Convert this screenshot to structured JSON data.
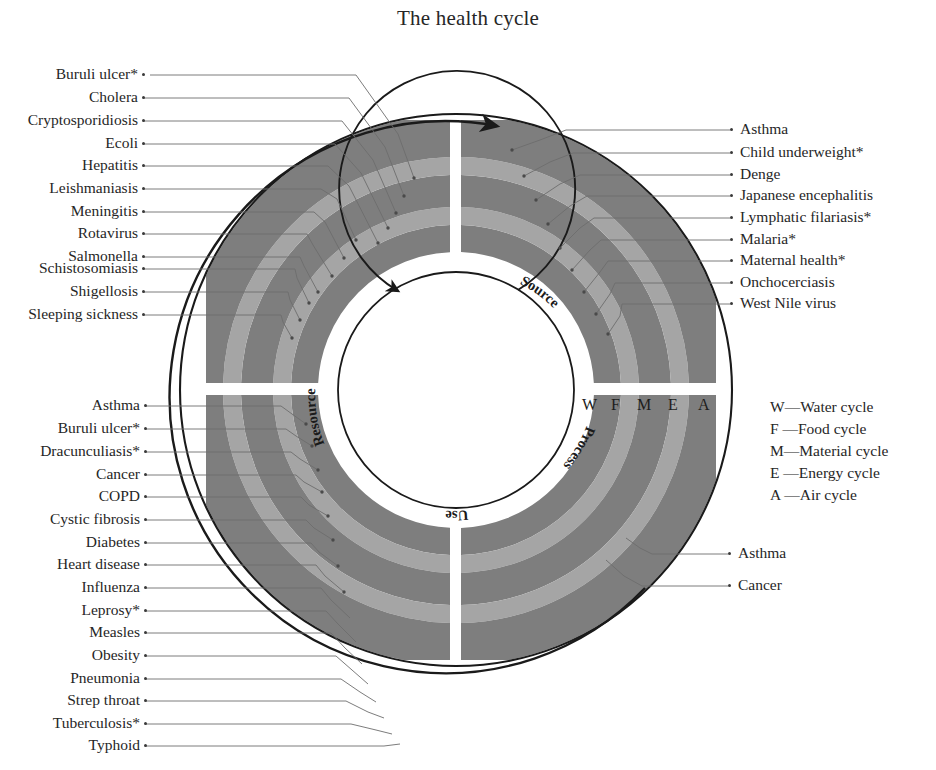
{
  "title": "The health cycle",
  "colors": {
    "band_dark": "#7e7e7e",
    "band_light": "#a5a5a5",
    "outline": "#1a1a1a",
    "leader": "#6d6d6d",
    "text": "#262626",
    "background": "#ffffff"
  },
  "chart_data": {
    "type": "diagram",
    "title": "The health cycle",
    "shape": "concentric-ring donut split into four quadrants",
    "rings": [
      {
        "code": "W",
        "name": "Water cycle",
        "order": 1,
        "tone": "dark"
      },
      {
        "code": "F",
        "name": "Food cycle",
        "order": 2,
        "tone": "light"
      },
      {
        "code": "M",
        "name": "Material cycle",
        "order": 3,
        "tone": "dark"
      },
      {
        "code": "E",
        "name": "Energy cycle",
        "order": 4,
        "tone": "light"
      },
      {
        "code": "A",
        "name": "Air cycle",
        "order": 5,
        "tone": "dark"
      }
    ],
    "quadrants": [
      "Source",
      "Process",
      "Use",
      "Resource"
    ],
    "ring_axis_labels": [
      "W",
      "F",
      "M",
      "E",
      "A"
    ],
    "direction": "clockwise",
    "groups": [
      {
        "quadrant": "Resource",
        "position": "top-left",
        "count": 12
      },
      {
        "quadrant": "Source",
        "position": "top-right",
        "count": 9
      },
      {
        "quadrant": "Use",
        "position": "bottom-left",
        "count": 15
      },
      {
        "quadrant": "Process",
        "position": "bottom-right",
        "count": 2
      }
    ]
  },
  "inner_labels": {
    "source": "Source",
    "process": "Process",
    "use": "Use",
    "resource": "Resource"
  },
  "ring_axis": {
    "w": "W",
    "f": "F",
    "m": "M",
    "e": "E",
    "a": "A"
  },
  "legend": {
    "items": [
      {
        "code": "W",
        "dash": "—",
        "label": "Water cycle",
        "text": "W—Water cycle"
      },
      {
        "code": "F",
        "dash": "—",
        "label": "Food cycle",
        "text": "F —Food cycle"
      },
      {
        "code": "M",
        "dash": "—",
        "label": "Material cycle",
        "text": "M—Material cycle"
      },
      {
        "code": "E",
        "dash": "—",
        "label": "Energy cycle",
        "text": "E —Energy cycle"
      },
      {
        "code": "A",
        "dash": "—",
        "label": "Air cycle",
        "text": "A —Air cycle"
      }
    ]
  },
  "labels_top_left": [
    {
      "text": "Buruli ulcer*",
      "y": 75
    },
    {
      "text": "Cholera",
      "y": 98
    },
    {
      "text": "Cryptosporidiosis",
      "y": 121
    },
    {
      "text": "Ecoli",
      "y": 144
    },
    {
      "text": "Hepatitis",
      "y": 166
    },
    {
      "text": "Leishmaniasis",
      "y": 189
    },
    {
      "text": "Meningitis",
      "y": 212
    },
    {
      "text": "Rotavirus",
      "y": 234
    },
    {
      "text": "Salmonella",
      "y": 257
    },
    {
      "text": "Schistosomiasis",
      "y": 269
    },
    {
      "text": "Shigellosis",
      "y": 292
    },
    {
      "text": "Sleeping sickness",
      "y": 315
    }
  ],
  "labels_bottom_left": [
    {
      "text": "Asthma",
      "y": 406
    },
    {
      "text": "Buruli ulcer*",
      "y": 429
    },
    {
      "text": "Dracunculiasis*",
      "y": 452
    },
    {
      "text": "Cancer",
      "y": 475
    },
    {
      "text": "COPD",
      "y": 497
    },
    {
      "text": "Cystic fibrosis",
      "y": 520
    },
    {
      "text": "Diabetes",
      "y": 543
    },
    {
      "text": "Heart disease",
      "y": 565
    },
    {
      "text": "Influenza",
      "y": 588
    },
    {
      "text": "Leprosy*",
      "y": 611
    },
    {
      "text": "Measles",
      "y": 633
    },
    {
      "text": "Obesity",
      "y": 656
    },
    {
      "text": "Pneumonia",
      "y": 679
    },
    {
      "text": "Strep throat",
      "y": 701
    },
    {
      "text": "Tuberculosis*",
      "y": 724
    },
    {
      "text": "Typhoid",
      "y": 746
    }
  ],
  "labels_top_right": [
    {
      "text": "Asthma",
      "y": 130
    },
    {
      "text": "Child underweight*",
      "y": 153
    },
    {
      "text": "Denge",
      "y": 175
    },
    {
      "text": "Japanese encephalitis",
      "y": 196
    },
    {
      "text": "Lymphatic filariasis*",
      "y": 218
    },
    {
      "text": "Malaria*",
      "y": 240
    },
    {
      "text": "Maternal health*",
      "y": 261
    },
    {
      "text": "Onchocerciasis",
      "y": 283
    },
    {
      "text": "West Nile virus",
      "y": 304
    }
  ],
  "labels_bottom_right": [
    {
      "text": "Asthma",
      "y": 554
    },
    {
      "text": "Cancer",
      "y": 586
    }
  ]
}
